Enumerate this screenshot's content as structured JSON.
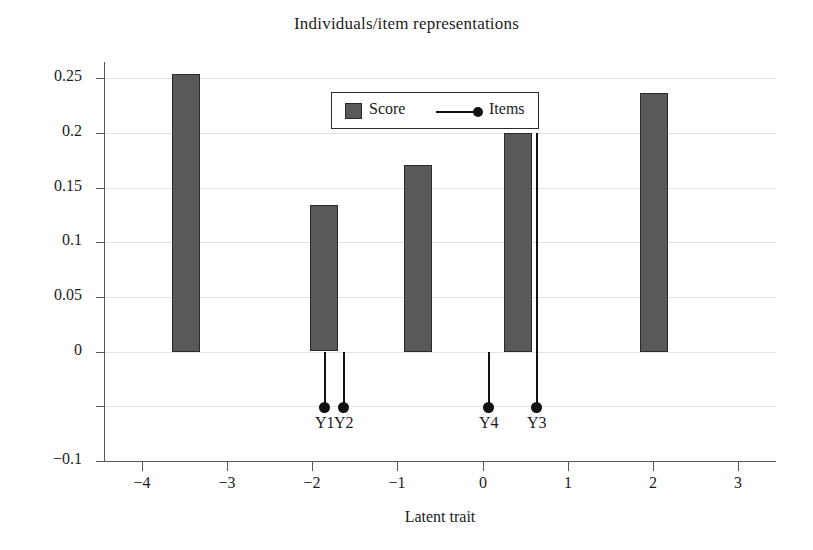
{
  "chart_data": {
    "type": "bar",
    "title": "Individuals/item representations",
    "xlabel": "Latent trait",
    "ylabel": "",
    "xlim": [
      -4.45,
      3.45
    ],
    "ylim": [
      -0.1,
      0.265
    ],
    "grid": true,
    "xticks": [
      "−4",
      "−3",
      "−2",
      "−1",
      "0",
      "1",
      "2",
      "3"
    ],
    "xtick_values": [
      -4,
      -3,
      -2,
      -1,
      0,
      1,
      2,
      3
    ],
    "yticks": [
      "0.25",
      "0.2",
      "0.15",
      "0.1",
      "0.05",
      "0",
      "−0.1"
    ],
    "ytick_values": [
      0.25,
      0.2,
      0.15,
      0.1,
      0.05,
      0,
      -0.1
    ],
    "legend": {
      "position": "upper-center",
      "entries": [
        {
          "label": "Score",
          "marker": "filled-square",
          "color": "#595959"
        },
        {
          "label": "Items",
          "marker": "line-with-dot",
          "color": "#111111"
        }
      ]
    },
    "series": [
      {
        "name": "Score",
        "type": "bar",
        "color": "#595959",
        "bar_width": 0.33,
        "points": [
          {
            "x": -3.48,
            "y": 0.254
          },
          {
            "x": -1.86,
            "y": 0.134
          },
          {
            "x": -0.76,
            "y": 0.171
          },
          {
            "x": 0.42,
            "y": 0.2
          },
          {
            "x": 2.02,
            "y": 0.237
          }
        ]
      },
      {
        "name": "Items",
        "type": "stem",
        "color": "#111111",
        "marker_y": -0.051,
        "points": [
          {
            "label": "Y1",
            "x": -1.86,
            "stem_top": 0.0
          },
          {
            "label": "Y2",
            "x": -1.64,
            "stem_top": 0.0
          },
          {
            "label": "Y4",
            "x": 0.06,
            "stem_top": 0.0
          },
          {
            "label": "Y3",
            "x": 0.63,
            "stem_top": 0.2
          }
        ]
      }
    ]
  },
  "colors": {
    "bar_fill": "#595959",
    "bar_edge": "#2b2b2b",
    "item_marker": "#111111",
    "grid": "#e2e2e2",
    "axis": "#58585a",
    "text": "#1b1b1b",
    "background": "#ffffff"
  }
}
